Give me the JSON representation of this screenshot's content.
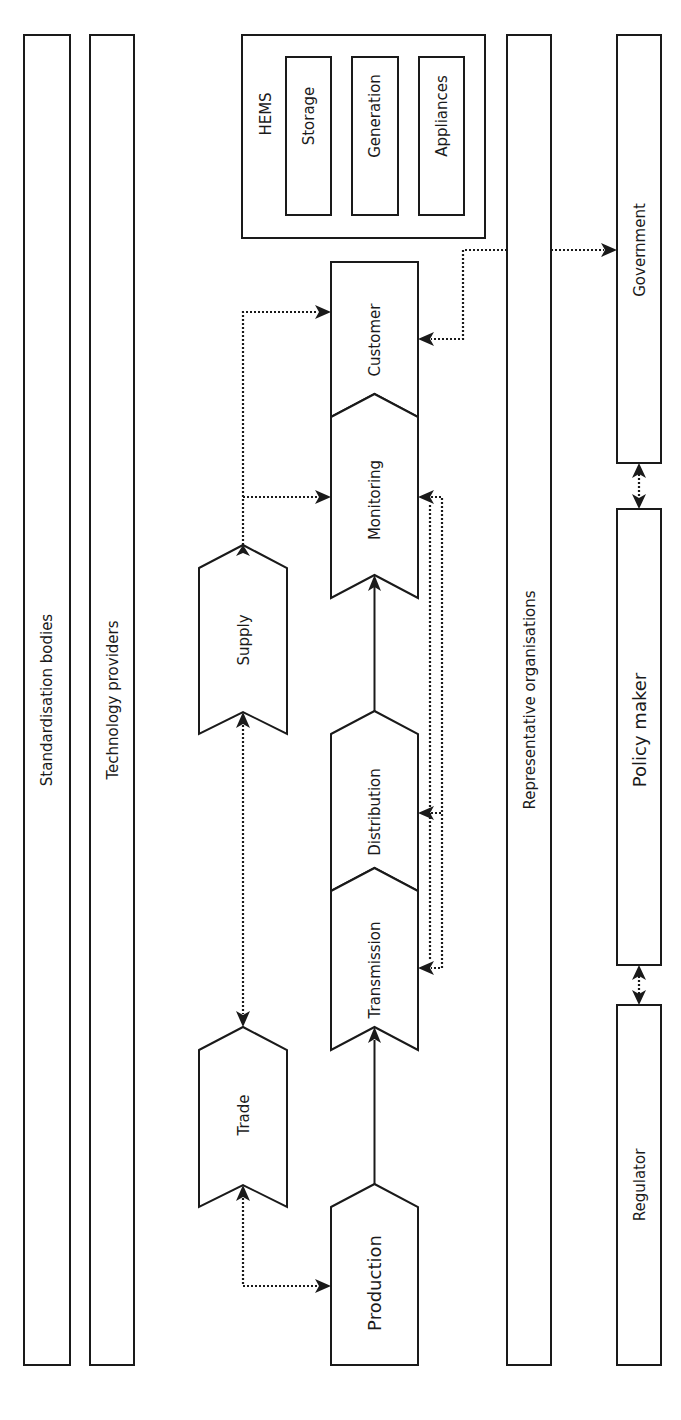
{
  "diagram": {
    "orientation": "rotated 90deg counter-clockwise (text reads bottom-to-top)",
    "side_bars": {
      "standardisation": "Standardisation bodies",
      "technology": "Technology providers",
      "representative": "Representative organisations"
    },
    "hems": {
      "title": "HEMS",
      "items": [
        "Storage",
        "Generation",
        "Appliances"
      ]
    },
    "value_chain": {
      "production": "Production",
      "transmission": "Transmission",
      "distribution": "Distribution",
      "monitoring": "Monitoring",
      "customer": "Customer"
    },
    "market": {
      "trade": "Trade",
      "supply": "Supply"
    },
    "governance": {
      "government": "Government",
      "policy_maker": "Policy maker",
      "regulator": "Regulator"
    },
    "connections": [
      {
        "from": "Production",
        "to": "Transmission",
        "style": "solid",
        "arrow": "end"
      },
      {
        "from": "Distribution",
        "to": "Monitoring",
        "style": "solid",
        "arrow": "none"
      },
      {
        "from": "Trade",
        "to": "Production",
        "style": "dotted",
        "arrow": "both"
      },
      {
        "from": "Trade",
        "to": "Supply",
        "style": "dotted",
        "arrow": "both"
      },
      {
        "from": "Supply",
        "to": "Monitoring",
        "style": "dotted",
        "arrow": "end"
      },
      {
        "from": "Supply",
        "to": "Customer",
        "style": "dotted",
        "arrow": "end"
      },
      {
        "from": "Monitoring",
        "to": "Distribution",
        "style": "dotted",
        "arrow": "both"
      },
      {
        "from": "Monitoring",
        "to": "Transmission",
        "style": "dotted",
        "arrow": "both"
      },
      {
        "from": "HEMS/Representative organisations",
        "to": "Customer",
        "style": "dotted",
        "arrow": "end"
      },
      {
        "from": "Representative organisations",
        "to": "Government",
        "style": "dotted",
        "arrow": "end"
      },
      {
        "from": "Government",
        "to": "Policy maker",
        "style": "dotted",
        "arrow": "both"
      },
      {
        "from": "Policy maker",
        "to": "Regulator",
        "style": "dotted",
        "arrow": "both"
      }
    ]
  }
}
